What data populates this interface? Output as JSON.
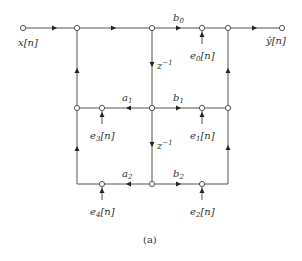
{
  "diagram": {
    "type": "signal-flow-graph",
    "caption": "(a)",
    "input_label": "x[n]",
    "output_label": "ŷ[n]",
    "delay_label": "z",
    "delay_exp": "−1",
    "coefficients": {
      "b0": {
        "base": "b",
        "sub": "0"
      },
      "b1": {
        "base": "b",
        "sub": "1"
      },
      "b2": {
        "base": "b",
        "sub": "2"
      },
      "a1": {
        "base": "a",
        "sub": "1"
      },
      "a2": {
        "base": "a",
        "sub": "2"
      }
    },
    "error_sources": [
      {
        "base": "e",
        "sub": "0",
        "suffix": "[n]"
      },
      {
        "base": "e",
        "sub": "1",
        "suffix": "[n]"
      },
      {
        "base": "e",
        "sub": "2",
        "suffix": "[n]"
      },
      {
        "base": "e",
        "sub": "3",
        "suffix": "[n]"
      },
      {
        "base": "e",
        "sub": "4",
        "suffix": "[n]"
      }
    ],
    "colors": {
      "line": "#555555",
      "text": "#333333",
      "background": "#ffffff"
    }
  }
}
